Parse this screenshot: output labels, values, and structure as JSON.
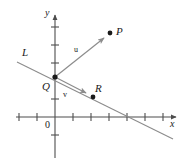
{
  "figure": {
    "background_color": "#ffffff",
    "axis_color": "#4d4d4d",
    "line_color": "#8c8c8c",
    "vector_color": "#8c8c8c",
    "point_color": "#1a1a1a",
    "text_color": "#1a1a1a"
  },
  "axes": {
    "x_label": "x",
    "y_label": "y",
    "origin_label": "0",
    "x_axis_y_px": 117,
    "y_axis_x_px": 55,
    "tick_spacing_px": 18,
    "x_ticks_px": [
      19,
      37,
      73,
      91,
      109,
      127,
      145,
      163
    ],
    "y_ticks_px": [
      27,
      45,
      63,
      99,
      135
    ],
    "x_arrow_tip_px": [
      178,
      117
    ],
    "y_arrow_tip_px": [
      55,
      9
    ]
  },
  "points": [
    {
      "name": "Q",
      "label": "Q",
      "x_px": 55,
      "y_px": 77,
      "label_x_px": 42,
      "label_y_px": 81
    },
    {
      "name": "P",
      "label": "P",
      "x_px": 110,
      "y_px": 33,
      "label_x_px": 116,
      "label_y_px": 26
    },
    {
      "name": "R",
      "label": "R",
      "x_px": 93,
      "y_px": 97,
      "label_x_px": 95,
      "label_y_px": 83
    }
  ],
  "vectors": [
    {
      "name": "u",
      "label": "u",
      "from_px": [
        55,
        77
      ],
      "to_px": [
        107,
        36
      ],
      "label_x_px": 74,
      "label_y_px": 46
    },
    {
      "name": "v",
      "label": "v",
      "from_px": [
        55,
        77
      ],
      "to_px": [
        90,
        95
      ],
      "label_x_px": 63,
      "label_y_px": 91
    }
  ],
  "line": {
    "name": "L",
    "label": "L",
    "start_px": [
      17,
      62
    ],
    "end_px": [
      173,
      139
    ],
    "label_x_px": 22,
    "label_y_px": 47
  }
}
